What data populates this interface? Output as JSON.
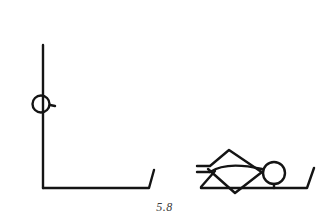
{
  "figure": {
    "caption": "5.8",
    "stroke_color": "#141414",
    "background": "#ffffff",
    "panels": [
      {
        "id": "standing",
        "description": "Stick figure standing upright: vertical body line with round head, base line with raised end"
      },
      {
        "id": "lying",
        "description": "Stick figure lying down on a base line with raised end, head at right, bent legs at left"
      }
    ]
  }
}
